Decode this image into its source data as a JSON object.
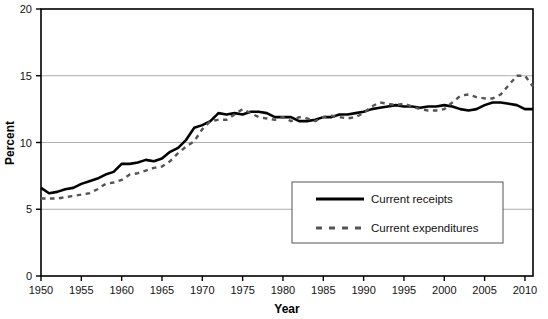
{
  "chart_data": {
    "type": "line",
    "title": "",
    "xlabel": "Year",
    "ylabel": "Percent",
    "xlim": [
      1950,
      2011
    ],
    "ylim": [
      0,
      20
    ],
    "ytick_values": [
      0,
      5,
      10,
      15,
      20
    ],
    "ytick_labels": [
      "0",
      "5",
      "10",
      "15",
      "20"
    ],
    "xtick_values": [
      1950,
      1955,
      1960,
      1965,
      1970,
      1975,
      1980,
      1985,
      1990,
      1995,
      2000,
      2005,
      2010
    ],
    "xtick_labels": [
      "1950",
      "1955",
      "1960",
      "1965",
      "1970",
      "1975",
      "1980",
      "1985",
      "1990",
      "1995",
      "2000",
      "2005",
      "2010"
    ],
    "grid": "horizontal",
    "legend_position": "inside-bottom-right",
    "x": [
      1950,
      1951,
      1952,
      1953,
      1954,
      1955,
      1956,
      1957,
      1958,
      1959,
      1960,
      1961,
      1962,
      1963,
      1964,
      1965,
      1966,
      1967,
      1968,
      1969,
      1970,
      1971,
      1972,
      1973,
      1974,
      1975,
      1976,
      1977,
      1978,
      1979,
      1980,
      1981,
      1982,
      1983,
      1984,
      1985,
      1986,
      1987,
      1988,
      1989,
      1990,
      1991,
      1992,
      1993,
      1994,
      1995,
      1996,
      1997,
      1998,
      1999,
      2000,
      2001,
      2002,
      2003,
      2004,
      2005,
      2006,
      2007,
      2008,
      2009,
      2010,
      2011
    ],
    "series": [
      {
        "name": "Current receipts",
        "style": "solid",
        "color": "#000000",
        "values": [
          6.6,
          6.2,
          6.3,
          6.5,
          6.6,
          6.9,
          7.1,
          7.3,
          7.6,
          7.8,
          8.4,
          8.4,
          8.5,
          8.7,
          8.6,
          8.8,
          9.3,
          9.6,
          10.2,
          11.1,
          11.3,
          11.6,
          12.2,
          12.1,
          12.2,
          12.1,
          12.3,
          12.3,
          12.2,
          11.9,
          11.9,
          11.9,
          11.6,
          11.6,
          11.7,
          11.9,
          11.9,
          12.1,
          12.1,
          12.2,
          12.3,
          12.5,
          12.6,
          12.7,
          12.8,
          12.7,
          12.7,
          12.6,
          12.7,
          12.7,
          12.8,
          12.7,
          12.5,
          12.4,
          12.5,
          12.8,
          13.0,
          13.0,
          12.9,
          12.8,
          12.5,
          12.5
        ],
        "width": 2.6
      },
      {
        "name": "Current expenditures",
        "style": "dashed",
        "color": "#555555",
        "values": [
          5.8,
          5.8,
          5.8,
          5.9,
          6.0,
          6.1,
          6.2,
          6.5,
          6.9,
          7.0,
          7.2,
          7.6,
          7.7,
          7.9,
          8.1,
          8.2,
          8.6,
          9.2,
          9.7,
          10.1,
          11.0,
          11.6,
          11.7,
          11.7,
          12.1,
          12.5,
          12.2,
          11.9,
          11.8,
          11.7,
          11.9,
          11.6,
          11.9,
          11.8,
          11.6,
          11.9,
          12.0,
          11.9,
          11.8,
          11.9,
          12.2,
          12.7,
          13.0,
          12.9,
          12.8,
          12.9,
          12.7,
          12.5,
          12.4,
          12.4,
          12.5,
          13.0,
          13.5,
          13.6,
          13.4,
          13.3,
          13.3,
          13.6,
          14.3,
          15.0,
          15.0,
          14.2
        ],
        "width": 2.4
      }
    ]
  },
  "axes": {
    "y_label": "Percent",
    "x_label": "Year"
  },
  "legend": {
    "items": [
      {
        "label": "Current receipts",
        "style": "solid"
      },
      {
        "label": "Current expenditures",
        "style": "dashed"
      }
    ]
  },
  "colors": {
    "frame": "#000000",
    "grid": "#999999",
    "background": "#ffffff",
    "receipts": "#000000",
    "expenditures": "#555555"
  }
}
